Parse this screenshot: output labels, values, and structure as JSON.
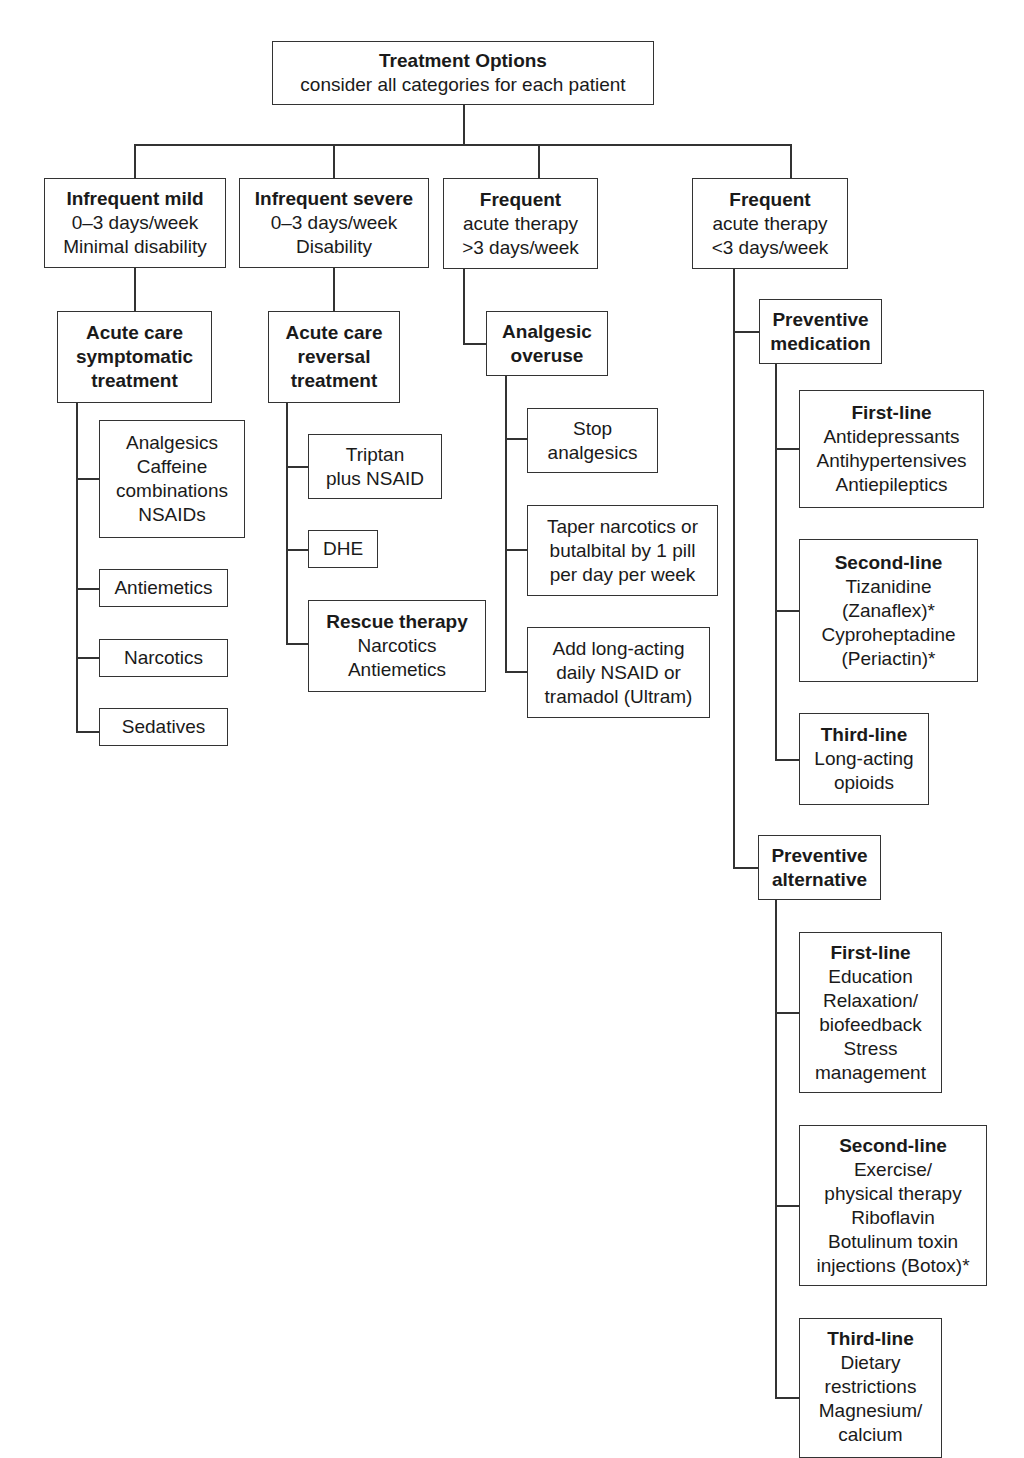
{
  "root": {
    "title": "Treatment Options",
    "subtitle": "consider all categories for each patient"
  },
  "categories": [
    {
      "title": "Infrequent mild",
      "lines": [
        "0–3 days/week",
        "Minimal disability"
      ]
    },
    {
      "title": "Infrequent severe",
      "lines": [
        "0–3 days/week",
        "Disability"
      ]
    },
    {
      "title": "Frequent",
      "lines": [
        "acute therapy",
        ">3 days/week"
      ]
    },
    {
      "title": "Frequent",
      "lines": [
        "acute therapy",
        "<3 days/week"
      ]
    }
  ],
  "branch1": {
    "head": [
      "Acute care",
      "symptomatic",
      "treatment"
    ],
    "items": [
      [
        "Analgesics",
        "Caffeine",
        "combinations",
        "NSAIDs"
      ],
      [
        "Antiemetics"
      ],
      [
        "Narcotics"
      ],
      [
        "Sedatives"
      ]
    ]
  },
  "branch2": {
    "head": [
      "Acute care",
      "reversal",
      "treatment"
    ],
    "items": [
      [
        "Triptan",
        "plus NSAID"
      ],
      [
        "DHE"
      ]
    ],
    "rescue": {
      "title": "Rescue therapy",
      "lines": [
        "Narcotics",
        "Antiemetics"
      ]
    }
  },
  "branch3": {
    "head": [
      "Analgesic",
      "overuse"
    ],
    "items": [
      [
        "Stop",
        "analgesics"
      ],
      [
        "Taper narcotics or",
        "butalbital by 1 pill",
        "per day per week"
      ],
      [
        "Add long-acting",
        "daily NSAID or",
        "tramadol (Ultram)"
      ]
    ]
  },
  "branch4": {
    "medication": {
      "head": [
        "Preventive",
        "medication"
      ],
      "items": [
        {
          "title": "First-line",
          "lines": [
            "Antidepressants",
            "Antihypertensives",
            "Antiepileptics"
          ]
        },
        {
          "title": "Second-line",
          "lines": [
            "Tizanidine",
            "(Zanaflex)*",
            "Cyproheptadine",
            "(Periactin)*"
          ]
        },
        {
          "title": "Third-line",
          "lines": [
            "Long-acting",
            "opioids"
          ]
        }
      ]
    },
    "alternative": {
      "head": [
        "Preventive",
        "alternative"
      ],
      "items": [
        {
          "title": "First-line",
          "lines": [
            "Education",
            "Relaxation/",
            "biofeedback",
            "Stress",
            "management"
          ]
        },
        {
          "title": "Second-line",
          "lines": [
            "Exercise/",
            "physical therapy",
            "Riboflavin",
            "Botulinum toxin",
            "injections (Botox)*"
          ]
        },
        {
          "title": "Third-line",
          "lines": [
            "Dietary",
            "restrictions",
            "Magnesium/",
            "calcium"
          ]
        }
      ]
    }
  },
  "colors": {
    "line": "#333333",
    "text": "#1a1a1a",
    "background": "#ffffff"
  }
}
